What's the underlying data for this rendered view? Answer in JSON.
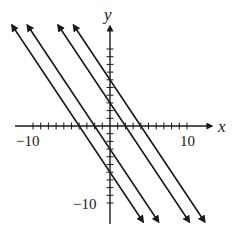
{
  "chart_data": {
    "type": "line",
    "title": "",
    "xlabel": "x",
    "ylabel": "y",
    "xlim": [
      -12,
      12
    ],
    "ylim": [
      -12,
      12
    ],
    "grid": false,
    "legend": null,
    "x_tick_labels": [
      "-10",
      "10"
    ],
    "y_tick_labels": [
      "-10"
    ],
    "tick_interval": 1,
    "series": [
      {
        "name": "y = -1.5x - 6",
        "slope": -1.5,
        "intercept": -6,
        "x_intercept": -4,
        "arrows": "both"
      },
      {
        "name": "y = -1.5x - 3",
        "slope": -1.5,
        "intercept": -3,
        "x_intercept": -2,
        "arrows": "both"
      },
      {
        "name": "y = -1.5x + 3",
        "slope": -1.5,
        "intercept": 3,
        "x_intercept": 2,
        "arrows": "both"
      },
      {
        "name": "y = -1.5x + 6",
        "slope": -1.5,
        "intercept": 6,
        "x_intercept": 4,
        "arrows": "both"
      }
    ]
  },
  "labels": {
    "x_axis": "x",
    "y_axis": "y",
    "x_neg": "−10",
    "x_pos": "10",
    "y_neg": "−10"
  },
  "colors": {
    "ink": "#1a1a1a",
    "background": "#ffffff"
  }
}
